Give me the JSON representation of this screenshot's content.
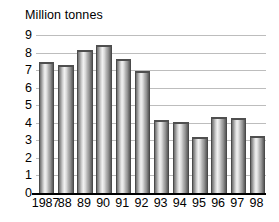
{
  "chart_data": {
    "type": "bar",
    "title": "Million tonnes",
    "xlabel": "",
    "ylabel": "Million tonnes",
    "categories": [
      "1987",
      "88",
      "89",
      "90",
      "91",
      "92",
      "93",
      "94",
      "95",
      "96",
      "97",
      "98"
    ],
    "values": [
      7.4,
      7.25,
      8.1,
      8.4,
      7.6,
      6.9,
      4.1,
      4.0,
      3.15,
      4.3,
      4.2,
      3.2
    ],
    "ylim": [
      0,
      9
    ],
    "yticks": [
      0,
      1,
      2,
      3,
      4,
      5,
      6,
      7,
      8,
      9
    ],
    "ytick_labels": [
      "0",
      "1",
      "2",
      "3",
      "4",
      "5",
      "6",
      "7",
      "8",
      "9"
    ],
    "grid": true,
    "grid_axis": "y",
    "legend": false,
    "legend_position": "none",
    "series": [
      {
        "name": "Million tonnes",
        "values": [
          7.4,
          7.25,
          8.1,
          8.4,
          7.6,
          6.9,
          4.1,
          4.0,
          3.15,
          4.3,
          4.2,
          3.2
        ]
      }
    ],
    "colors": {
      "bar_light": "#f2f2f2",
      "bar_mid": "#b4b4b4",
      "bar_dark": "#5a5a5a",
      "gridline": "#bdbdbd",
      "axis": "#000000",
      "text": "#000000",
      "background": "#ffffff"
    }
  }
}
